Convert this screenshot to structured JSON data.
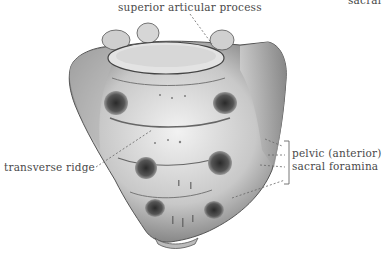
{
  "figure": {
    "labels": {
      "superior_articular_process": "superior articular process",
      "transverse_ridge": "transverse ridge",
      "pelvic_foramina_line1": "pelvic (anterior)",
      "pelvic_foramina_line2": "sacral foramina",
      "cropped_label": "sacral"
    },
    "colors": {
      "background": "#ffffff",
      "label_text": "#4a4a4a",
      "leader_line": "#666666",
      "bone_light": "#e6e6e6",
      "bone_mid": "#a8a8a8",
      "bone_dark": "#3c3c3c"
    }
  }
}
